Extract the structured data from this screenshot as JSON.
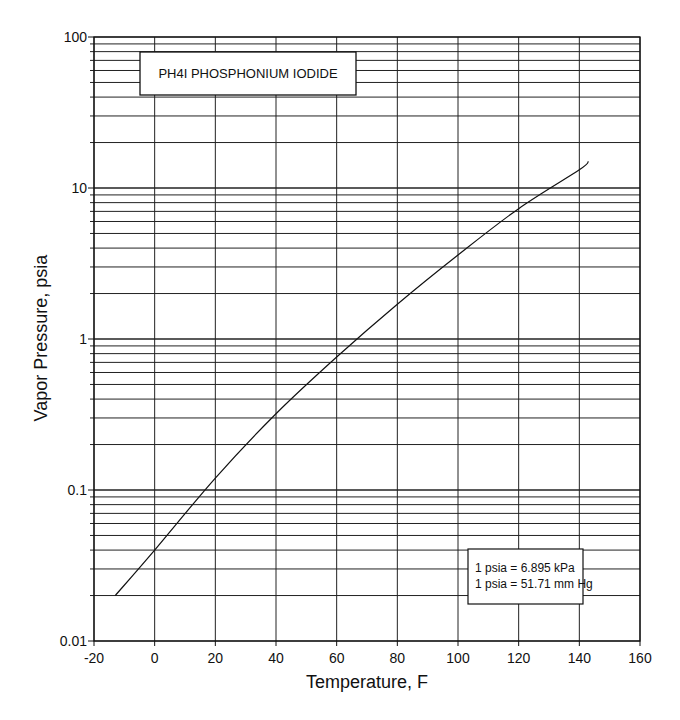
{
  "chart_data": {
    "type": "line",
    "title": "PH4I  PHOSPHONIUM IODIDE",
    "xlabel": "Temperature, F",
    "ylabel": "Vapor Pressure, psia",
    "xlim": [
      -20,
      160
    ],
    "ylim": [
      0.01,
      100
    ],
    "yscale": "log",
    "grid": true,
    "x_ticks": [
      "-20",
      "0",
      "20",
      "40",
      "60",
      "80",
      "100",
      "120",
      "140",
      "160"
    ],
    "y_ticks": [
      "0.01",
      "0.1",
      "1",
      "10",
      "100"
    ],
    "series": [
      {
        "name": "PH4I Phosphonium Iodide",
        "x": [
          -13,
          0,
          20,
          40,
          60,
          80,
          100,
          120,
          140,
          143
        ],
        "y": [
          0.02,
          0.04,
          0.12,
          0.32,
          0.76,
          1.7,
          3.6,
          7.3,
          13.2,
          15
        ]
      }
    ],
    "annotations": [
      "1 psia = 6.895 kPa",
      "1 psia = 51.71 mm Hg"
    ],
    "legend": "none"
  },
  "title_box": {
    "text": "PH4I  PHOSPHONIUM IODIDE"
  },
  "conversion_box": {
    "line1": "1 psia = 6.895 kPa",
    "line2": "1 psia = 51.71 mm Hg"
  },
  "axes": {
    "x_title": "Temperature, F",
    "y_title": "Vapor Pressure, psia"
  }
}
